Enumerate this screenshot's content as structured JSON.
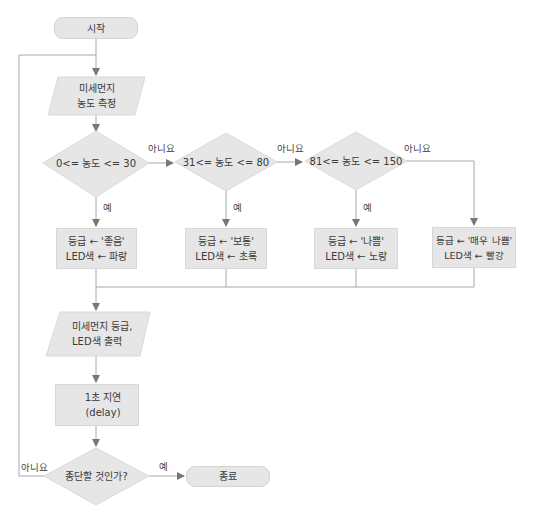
{
  "flowchart": {
    "start": "시작",
    "measure": {
      "line1": "미세먼지",
      "line2": "농도 측정"
    },
    "conditions": [
      {
        "text": "0<= 농도 <= 30",
        "yes": "예",
        "no": "아니요"
      },
      {
        "text": "31<= 농도 <= 80",
        "yes": "예",
        "no": "아니요"
      },
      {
        "text": "81<= 농도 <= 150",
        "yes": "예",
        "no": "아니요"
      }
    ],
    "results": [
      {
        "line1": "등급 ← '좋음'",
        "line2": "LED색 ← 파랑"
      },
      {
        "line1": "등급 ← '보통'",
        "line2": "LED색 ← 초록"
      },
      {
        "line1": "등급 ← '나쁨'",
        "line2": "LED색 ← 노랑"
      },
      {
        "line1": "등급 ← '매우 나쁨'",
        "line2": "LED색 ← 빨강"
      }
    ],
    "output": {
      "line1": "미세먼지 등급,",
      "line2": "LED색 출력"
    },
    "delay": "1초 지연(delay)",
    "stop_check": {
      "text": "종단할 것인가?",
      "yes": "예",
      "no": "아니요"
    },
    "end": "종료"
  },
  "colors": {
    "shape_fill": "#e6e6e6",
    "line": "#a8a8a8",
    "arrow": "#777777"
  }
}
